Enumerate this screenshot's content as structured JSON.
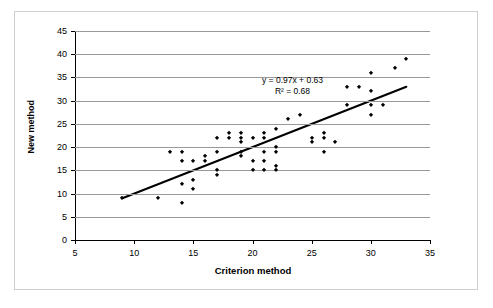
{
  "chart_data": {
    "type": "scatter",
    "title": "",
    "xlabel": "Criterion method",
    "ylabel": "New method",
    "xlim": [
      5,
      35
    ],
    "ylim": [
      0,
      45
    ],
    "xticks": [
      5,
      10,
      15,
      20,
      25,
      30,
      35
    ],
    "yticks": [
      0,
      5,
      10,
      15,
      20,
      25,
      30,
      35,
      40,
      45
    ],
    "grid": "horizontal",
    "legend": "none",
    "annotations": {
      "equation": "y = 0.97x + 0.63",
      "r_squared": "R² = 0.68"
    },
    "trendline": {
      "type": "linear",
      "slope": 0.97,
      "intercept": 0.63,
      "r2": 0.68,
      "x_start": 9,
      "y_start": 9,
      "x_end": 33,
      "y_end": 33
    },
    "marker_color": "#000000",
    "marker_shape": "diamond",
    "points": [
      [
        9,
        9
      ],
      [
        12,
        9
      ],
      [
        13,
        19
      ],
      [
        14,
        8
      ],
      [
        14,
        12
      ],
      [
        14,
        17
      ],
      [
        14,
        19
      ],
      [
        15,
        11
      ],
      [
        15,
        13
      ],
      [
        15,
        17
      ],
      [
        16,
        17
      ],
      [
        16,
        18
      ],
      [
        17,
        14
      ],
      [
        17,
        15
      ],
      [
        17,
        19
      ],
      [
        17,
        22
      ],
      [
        18,
        22
      ],
      [
        18,
        23
      ],
      [
        19,
        18
      ],
      [
        19,
        19
      ],
      [
        19,
        21
      ],
      [
        19,
        22
      ],
      [
        19,
        23
      ],
      [
        20,
        15
      ],
      [
        20,
        17
      ],
      [
        20,
        22
      ],
      [
        21,
        15
      ],
      [
        21,
        17
      ],
      [
        21,
        19
      ],
      [
        21,
        22
      ],
      [
        21,
        23
      ],
      [
        22,
        15
      ],
      [
        22,
        16
      ],
      [
        22,
        19
      ],
      [
        22,
        20
      ],
      [
        22,
        24
      ],
      [
        23,
        26
      ],
      [
        24,
        27
      ],
      [
        25,
        21
      ],
      [
        25,
        22
      ],
      [
        26,
        19
      ],
      [
        26,
        22
      ],
      [
        26,
        23
      ],
      [
        27,
        21
      ],
      [
        28,
        29
      ],
      [
        28,
        33
      ],
      [
        29,
        33
      ],
      [
        30,
        27
      ],
      [
        30,
        29
      ],
      [
        30,
        32
      ],
      [
        30,
        36
      ],
      [
        31,
        29
      ],
      [
        32,
        37
      ],
      [
        33,
        39
      ]
    ]
  },
  "axes": {
    "x_title": "Criterion method",
    "y_title": "New method"
  }
}
